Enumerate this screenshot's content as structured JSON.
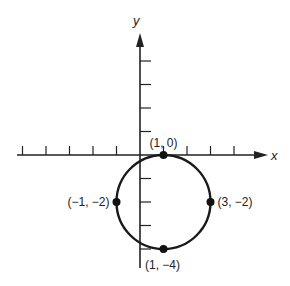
{
  "diagram": {
    "type": "circle-on-cartesian-plane",
    "axes": {
      "x_label": "x",
      "y_label": "y",
      "unit_px": 23.5,
      "origin_px": [
        140,
        155
      ],
      "x_ticks": [
        -5,
        -4,
        -3,
        -2,
        -1,
        1,
        2,
        3,
        4
      ],
      "y_ticks": [
        4,
        3,
        2,
        1,
        -1,
        -2,
        -3,
        -4
      ],
      "stroke_color": "#222222"
    },
    "circle": {
      "center": [
        1,
        -2
      ],
      "radius": 2,
      "stroke_color": "#1a1a1a"
    },
    "points": [
      {
        "coords": [
          1,
          0
        ],
        "label": "(1, 0)",
        "label_pos": "top"
      },
      {
        "coords": [
          -1,
          -2
        ],
        "label": "(−1, −2)",
        "label_pos": "left"
      },
      {
        "coords": [
          3,
          -2
        ],
        "label": "(3, −2)",
        "label_pos": "right"
      },
      {
        "coords": [
          1,
          -4
        ],
        "label": "(1, −4)",
        "label_pos": "bottom"
      }
    ]
  }
}
